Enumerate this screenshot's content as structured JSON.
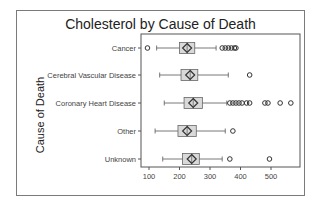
{
  "chart_data": {
    "type": "boxplot",
    "title": "Cholesterol by Cause of Death",
    "xlabel": "",
    "ylabel": "Cause of Death",
    "xlim": [
      75,
      600
    ],
    "xticks": [
      100,
      200,
      300,
      400,
      500
    ],
    "grid": false,
    "legend": null,
    "categories": [
      "Cancer",
      "Cerebral Vascular Disease",
      "Coronary Heart Disease",
      "Other",
      "Unknown"
    ],
    "series": [
      {
        "name": "Cancer",
        "whisker_low": 125,
        "q1": 200,
        "q3": 250,
        "mean": 225,
        "whisker_high": 320,
        "outliers": [
          95,
          340,
          350,
          360,
          370,
          380,
          385
        ]
      },
      {
        "name": "Cerebral Vascular Disease",
        "whisker_low": 135,
        "q1": 205,
        "q3": 260,
        "mean": 235,
        "whisker_high": 360,
        "outliers": [
          430
        ]
      },
      {
        "name": "Coronary Heart Disease",
        "whisker_low": 150,
        "q1": 215,
        "q3": 275,
        "mean": 245,
        "whisker_high": 355,
        "outliers": [
          365,
          375,
          385,
          395,
          405,
          420,
          430,
          480,
          490,
          530,
          565
        ]
      },
      {
        "name": "Other",
        "whisker_low": 120,
        "q1": 195,
        "q3": 255,
        "mean": 225,
        "whisker_high": 350,
        "outliers": [
          375
        ]
      },
      {
        "name": "Unknown",
        "whisker_low": 145,
        "q1": 210,
        "q3": 265,
        "mean": 240,
        "whisker_high": 340,
        "outliers": [
          365,
          495
        ]
      }
    ],
    "colors": {
      "box_fill": "#d9d9d9",
      "box_stroke": "#666666",
      "line": "#555555",
      "outlier": "#333333"
    }
  }
}
